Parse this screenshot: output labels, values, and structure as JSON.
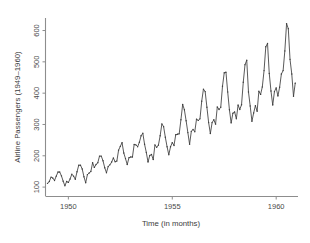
{
  "chart_data": {
    "type": "line",
    "title": "",
    "subtitle": "",
    "xlabel": "Time (in months)",
    "ylabel": "Airline Passengers (1949–1960)",
    "xlim": [
      1948.9,
      1961.05
    ],
    "ylim": [
      70,
      640
    ],
    "grid": false,
    "legend": null,
    "legend_position": "none",
    "x_tick_labels": [
      "1950",
      "1955",
      "1960"
    ],
    "x_tick_values": [
      1950,
      1955,
      1960
    ],
    "y_tick_labels": [
      "100",
      "200",
      "300",
      "400",
      "500",
      "600"
    ],
    "y_tick_values": [
      100,
      200,
      300,
      400,
      500,
      600
    ],
    "x_start": 1949.0,
    "x_step_months": 1,
    "series": [
      {
        "name": "Airline Passengers",
        "color": "#3c3c3c",
        "marker": "point",
        "values": [
          112,
          118,
          132,
          129,
          121,
          135,
          148,
          148,
          136,
          119,
          104,
          118,
          115,
          126,
          141,
          135,
          125,
          149,
          170,
          170,
          158,
          133,
          114,
          140,
          145,
          150,
          178,
          163,
          172,
          178,
          199,
          199,
          184,
          162,
          146,
          166,
          171,
          180,
          193,
          181,
          183,
          218,
          230,
          242,
          209,
          191,
          172,
          194,
          196,
          196,
          236,
          235,
          229,
          243,
          264,
          272,
          237,
          211,
          180,
          201,
          204,
          188,
          235,
          227,
          234,
          264,
          302,
          293,
          259,
          229,
          203,
          229,
          242,
          233,
          267,
          269,
          270,
          315,
          364,
          347,
          312,
          274,
          237,
          278,
          284,
          277,
          317,
          313,
          318,
          374,
          413,
          405,
          355,
          306,
          271,
          306,
          315,
          301,
          356,
          348,
          355,
          422,
          465,
          467,
          404,
          347,
          305,
          336,
          340,
          318,
          362,
          348,
          363,
          435,
          491,
          505,
          404,
          359,
          310,
          337,
          360,
          342,
          406,
          396,
          420,
          472,
          548,
          559,
          463,
          407,
          362,
          405,
          417,
          391,
          419,
          461,
          472,
          535,
          622,
          606,
          508,
          461,
          390,
          432
        ]
      }
    ]
  },
  "figure": {
    "background_color": "#ffffff",
    "axis_color": "#8d8d8d",
    "text_color": "#3c3c3c"
  }
}
